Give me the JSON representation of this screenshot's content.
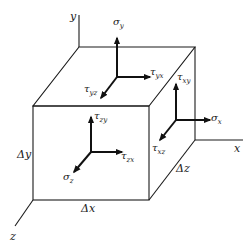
{
  "diagram": {
    "title": "",
    "axes": {
      "x": "x",
      "y": "y",
      "z": "z"
    },
    "dimensions": {
      "dx": "Δx",
      "dy": "Δy",
      "dz": "Δz"
    },
    "top_face": {
      "normal": "σ",
      "normal_sub": "y",
      "shear_x": "τ",
      "shear_x_sub": "yx",
      "shear_z": "τ",
      "shear_z_sub": "yz"
    },
    "right_face": {
      "normal": "σ",
      "normal_sub": "x",
      "shear_y": "τ",
      "shear_y_sub": "xy",
      "shear_z": "τ",
      "shear_z_sub": "xz"
    },
    "front_face": {
      "normal": "σ",
      "normal_sub": "z",
      "shear_y": "τ",
      "shear_y_sub": "zy",
      "shear_x": "τ",
      "shear_x_sub": "zx"
    },
    "colors": {
      "line": "#1a1a1a",
      "background": "#ffffff"
    }
  }
}
